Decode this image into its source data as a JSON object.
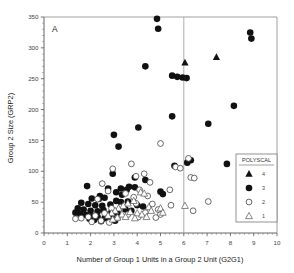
{
  "panel": {
    "label": "A"
  },
  "chart_data": {
    "type": "scatter",
    "title": "",
    "xlabel": "Number of Group 1 Units in a Group 2 Unit (G2G1)",
    "ylabel": "Group 2 Size (GRP2)",
    "xlim": [
      0,
      10
    ],
    "ylim": [
      0,
      350
    ],
    "xticks": [
      0,
      1,
      2,
      3,
      4,
      5,
      6,
      7,
      8,
      9,
      10
    ],
    "yticks": [
      0,
      50,
      100,
      150,
      200,
      250,
      300,
      350
    ],
    "xtick_labels": [
      "0",
      "1",
      "2",
      "3",
      "4",
      "5",
      "6",
      "7",
      "8",
      "9",
      "10"
    ],
    "ytick_labels": [
      "0",
      "50",
      "100",
      "150",
      "200",
      "250",
      "300",
      "350"
    ],
    "grid": false,
    "minor_ticks": true,
    "reference_lines": [
      {
        "axis": "x",
        "value": 6,
        "color": "#999999"
      }
    ],
    "legend": {
      "title": "POLYSCAL",
      "position": "bottom-right-inside",
      "entries": [
        {
          "label": "4",
          "marker": "filled-triangle"
        },
        {
          "label": "3",
          "marker": "filled-circle"
        },
        {
          "label": "2",
          "marker": "open-circle"
        },
        {
          "label": "1",
          "marker": "open-triangle"
        }
      ]
    },
    "series": [
      {
        "name": "4",
        "marker": "filled-triangle",
        "points": [
          [
            6.05,
            276
          ],
          [
            7.4,
            285
          ]
        ]
      },
      {
        "name": "3",
        "marker": "filled-circle",
        "points": [
          [
            4.85,
            347
          ],
          [
            4.9,
            331
          ],
          [
            8.85,
            325
          ],
          [
            8.9,
            315
          ],
          [
            4.35,
            270
          ],
          [
            5.5,
            255
          ],
          [
            5.72,
            253
          ],
          [
            5.95,
            252
          ],
          [
            6.12,
            251
          ],
          [
            8.15,
            206
          ],
          [
            5.5,
            189
          ],
          [
            7.05,
            177
          ],
          [
            4.05,
            171
          ],
          [
            3.0,
            159
          ],
          [
            3.2,
            140
          ],
          [
            6.3,
            118
          ],
          [
            6.15,
            114
          ],
          [
            7.85,
            112
          ],
          [
            5.6,
            109
          ],
          [
            2.95,
            96
          ],
          [
            3.9,
            90
          ],
          [
            4.35,
            86
          ],
          [
            1.85,
            76
          ],
          [
            3.65,
            75
          ],
          [
            3.9,
            74
          ],
          [
            3.3,
            72
          ],
          [
            3.55,
            70
          ],
          [
            5.0,
            67
          ],
          [
            5.1,
            63
          ],
          [
            2.75,
            72
          ],
          [
            3.1,
            66
          ],
          [
            3.35,
            62
          ],
          [
            2.4,
            60
          ],
          [
            2.05,
            56
          ],
          [
            2.35,
            55
          ],
          [
            2.6,
            57
          ],
          [
            3.1,
            52
          ],
          [
            3.3,
            50
          ],
          [
            3.6,
            51
          ],
          [
            1.6,
            49
          ],
          [
            1.9,
            47
          ],
          [
            2.2,
            45
          ],
          [
            2.5,
            44
          ],
          [
            2.85,
            46
          ],
          [
            4.0,
            45
          ],
          [
            4.25,
            43
          ],
          [
            1.45,
            40
          ],
          [
            1.7,
            38
          ],
          [
            2.0,
            36
          ],
          [
            2.3,
            35
          ],
          [
            2.55,
            37
          ],
          [
            2.9,
            34
          ],
          [
            3.15,
            33
          ],
          [
            1.35,
            33
          ],
          [
            1.55,
            31
          ],
          [
            1.8,
            29
          ],
          [
            2.05,
            27
          ],
          [
            2.3,
            26
          ],
          [
            2.6,
            24
          ],
          [
            2.85,
            22
          ],
          [
            3.05,
            20
          ],
          [
            2.45,
            19
          ],
          [
            2.15,
            21
          ],
          [
            1.95,
            23
          ],
          [
            3.5,
            38
          ],
          [
            3.75,
            36
          ],
          [
            2.7,
            30
          ],
          [
            2.95,
            28
          ]
        ]
      },
      {
        "name": "2",
        "marker": "open-circle",
        "points": [
          [
            5.0,
            145
          ],
          [
            6.2,
            121
          ],
          [
            3.75,
            112
          ],
          [
            5.65,
            107
          ],
          [
            5.85,
            105
          ],
          [
            2.95,
            104
          ],
          [
            6.3,
            90
          ],
          [
            6.45,
            89
          ],
          [
            4.3,
            96
          ],
          [
            3.95,
            92
          ],
          [
            4.55,
            82
          ],
          [
            2.5,
            80
          ],
          [
            5.4,
            70
          ],
          [
            4.1,
            70
          ],
          [
            2.75,
            68
          ],
          [
            3.5,
            64
          ],
          [
            4.45,
            60
          ],
          [
            3.85,
            58
          ],
          [
            2.3,
            55
          ],
          [
            7.05,
            51
          ],
          [
            6.4,
            36
          ],
          [
            5.45,
            45
          ],
          [
            4.65,
            47
          ],
          [
            4.35,
            33
          ],
          [
            3.3,
            42
          ],
          [
            2.9,
            40
          ],
          [
            3.6,
            30
          ],
          [
            2.6,
            32
          ],
          [
            2.2,
            28
          ],
          [
            1.9,
            26
          ],
          [
            1.6,
            24
          ],
          [
            1.35,
            23
          ],
          [
            4.05,
            26
          ],
          [
            3.15,
            24
          ],
          [
            2.45,
            20
          ],
          [
            2.05,
            18
          ],
          [
            2.8,
            17
          ],
          [
            5.0,
            30
          ],
          [
            4.8,
            25
          ],
          [
            3.95,
            48
          ],
          [
            4.9,
            38
          ]
        ]
      },
      {
        "name": "1",
        "marker": "open-triangle",
        "points": [
          [
            4.15,
            66
          ],
          [
            4.3,
            64
          ],
          [
            6.05,
            44
          ],
          [
            5.0,
            40
          ],
          [
            3.85,
            52
          ],
          [
            3.6,
            48
          ],
          [
            3.4,
            44
          ],
          [
            3.2,
            40
          ],
          [
            4.5,
            42
          ],
          [
            4.6,
            36
          ],
          [
            3.05,
            36
          ],
          [
            2.9,
            32
          ],
          [
            3.7,
            34
          ],
          [
            4.0,
            32
          ],
          [
            4.2,
            30
          ],
          [
            3.35,
            30
          ],
          [
            2.75,
            28
          ],
          [
            3.5,
            26
          ],
          [
            3.9,
            24
          ],
          [
            4.4,
            26
          ],
          [
            3.15,
            25
          ],
          [
            2.95,
            22
          ],
          [
            5.1,
            33
          ]
        ]
      }
    ]
  }
}
